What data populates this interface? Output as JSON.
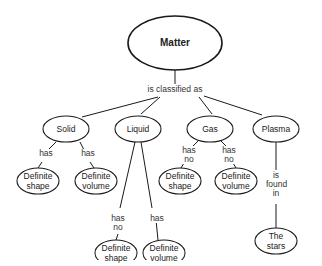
{
  "diagram": {
    "type": "concept-map",
    "root": {
      "label": "Matter"
    },
    "root_link": "is classified as",
    "nodes": {
      "solid": "Solid",
      "liquid": "Liquid",
      "gas": "Gas",
      "plasma": "Plasma",
      "solid_shape": "Definite\nshape",
      "solid_volume": "Definite\nvolume",
      "liquid_shape": "Definite\nshape",
      "liquid_volume": "Definite\nvolume",
      "gas_shape": "Definite\nshape",
      "gas_volume": "Definite\nvolume",
      "stars": "The\nstars"
    },
    "links": {
      "solid_shape": "has",
      "solid_volume": "has",
      "liquid_shape": "has\nno",
      "liquid_volume": "has",
      "gas_shape": "has\nno",
      "gas_volume": "has\nno",
      "plasma_stars": "is\nfound\nin"
    },
    "colors": {
      "stroke": "#1a1a1a",
      "fill": "#ffffff",
      "text": "#222222"
    }
  }
}
